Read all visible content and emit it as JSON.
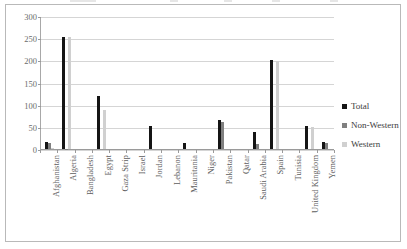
{
  "chart_data": {
    "type": "bar",
    "title": "",
    "subtitle": "",
    "xlabel": "",
    "ylabel": "",
    "ylim": [
      0,
      300
    ],
    "yticks": [
      0,
      50,
      100,
      150,
      200,
      250,
      300
    ],
    "grid": true,
    "legend_position": "right",
    "categories": [
      "Afghanistan",
      "Algeria",
      "Bangladesh",
      "Egypt",
      "Gaza Strip",
      "Israel",
      "Jordan",
      "Lebanon",
      "Mauritania",
      "Niger",
      "Pakistan",
      "Qatar",
      "Saudi Arabia",
      "Spain",
      "Tunisia",
      "United Kingdom",
      "Yemen"
    ],
    "series": [
      {
        "name": "Total",
        "color": "#151515",
        "values": [
          15,
          253,
          0,
          120,
          0,
          0,
          52,
          0,
          14,
          0,
          65,
          0,
          38,
          200,
          0,
          52,
          15
        ]
      },
      {
        "name": "Non-Western",
        "color": "#808080",
        "values": [
          13,
          1,
          0,
          0,
          0,
          0,
          0,
          0,
          0,
          0,
          60,
          0,
          12,
          0,
          0,
          0,
          14
        ]
      },
      {
        "name": "Western",
        "color": "#d0d0d0",
        "values": [
          2,
          252,
          0,
          88,
          0,
          0,
          0,
          0,
          0,
          0,
          0,
          0,
          0,
          198,
          0,
          50,
          0
        ]
      }
    ]
  },
  "legend": {
    "items": [
      {
        "label": "Total",
        "color": "#151515"
      },
      {
        "label": "Non-Western",
        "color": "#808080"
      },
      {
        "label": "Western",
        "color": "#d0d0d0"
      }
    ]
  }
}
